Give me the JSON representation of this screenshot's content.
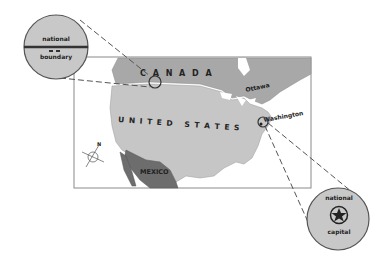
{
  "map": {
    "countries": {
      "canada": "C A N A D A",
      "usa": "U N I T E D   S T A T E S",
      "mexico": "MEXICO"
    },
    "cities": {
      "ottawa": "Ottawa",
      "washington": "Washington"
    },
    "compass": {
      "north": "N"
    },
    "colors": {
      "land": "#c8c8c8",
      "canada": "#a9a9a9",
      "mexico": "#6e6e6e",
      "water": "#ffffff",
      "frame": "#888888"
    }
  },
  "callouts": {
    "boundary": {
      "line1": "national",
      "line2": "boundary"
    },
    "capital": {
      "line1": "national",
      "line2": "capital"
    }
  }
}
